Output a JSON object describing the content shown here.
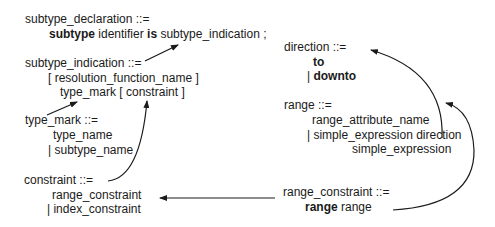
{
  "rules": {
    "subtype_declaration": {
      "head": "subtype_declaration ::=",
      "body": {
        "kw1": "subtype",
        "t1": " identifier ",
        "kw2": "is",
        "t2": " subtype_indication ;"
      }
    },
    "subtype_indication": {
      "head": "subtype_indication ::=",
      "line1": "[ resolution_function_name ]",
      "line2": "type_mark [ constraint ]"
    },
    "type_mark": {
      "head": "type_mark ::=",
      "line1": "type_name",
      "line2": "| subtype_name"
    },
    "constraint": {
      "head": "constraint ::=",
      "line1": "range_constraint",
      "line2": "| index_constraint"
    },
    "direction": {
      "head": "direction ::=",
      "line1": "to",
      "bar": "| ",
      "line2": "downto"
    },
    "range": {
      "head": "range ::=",
      "line1": "range_attribute_name",
      "line2": "| simple_expression direction",
      "line3": "simple_expression"
    },
    "range_constraint": {
      "head": "range_constraint ::=",
      "kw": "range",
      "t": " range"
    }
  },
  "arrows": [
    {
      "from": "subtype_indication",
      "to": "subtype_declaration"
    },
    {
      "from": "type_mark",
      "to": "subtype_indication"
    },
    {
      "from": "constraint",
      "to": "subtype_indication"
    },
    {
      "from": "range_constraint",
      "to": "constraint"
    },
    {
      "from": "range_constraint",
      "to": "range"
    },
    {
      "from": "range",
      "to": "direction"
    }
  ]
}
